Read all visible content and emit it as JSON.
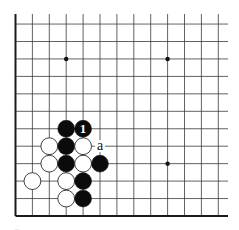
{
  "diagram": {
    "type": "go-board-fragment",
    "board": {
      "columns": 13,
      "rows": 12,
      "visible_edges": [
        "left",
        "bottom"
      ],
      "open_edges": [
        "top",
        "right"
      ],
      "line_color": "#3a3a3a",
      "edge_color": "#1a1a1a",
      "background": "#ffffff"
    },
    "star_points": [
      {
        "col": 3,
        "row": 2
      },
      {
        "col": 9,
        "row": 2
      },
      {
        "col": 9,
        "row": 8
      }
    ],
    "stones": [
      {
        "color": "black",
        "col": 3,
        "row": 6
      },
      {
        "color": "black",
        "col": 4,
        "row": 6,
        "label": "1"
      },
      {
        "color": "white",
        "col": 2,
        "row": 7
      },
      {
        "color": "black",
        "col": 3,
        "row": 7
      },
      {
        "color": "white",
        "col": 4,
        "row": 7
      },
      {
        "color": "white",
        "col": 2,
        "row": 8
      },
      {
        "color": "black",
        "col": 3,
        "row": 8
      },
      {
        "color": "white",
        "col": 4,
        "row": 8
      },
      {
        "color": "black",
        "col": 5,
        "row": 8
      },
      {
        "color": "white",
        "col": 1,
        "row": 9
      },
      {
        "color": "white",
        "col": 3,
        "row": 9
      },
      {
        "color": "black",
        "col": 4,
        "row": 9
      },
      {
        "color": "white",
        "col": 3,
        "row": 10
      },
      {
        "color": "black",
        "col": 4,
        "row": 10
      }
    ],
    "markers": [
      {
        "text": "a",
        "col": 5,
        "row": 7
      }
    ],
    "caption": "..."
  }
}
